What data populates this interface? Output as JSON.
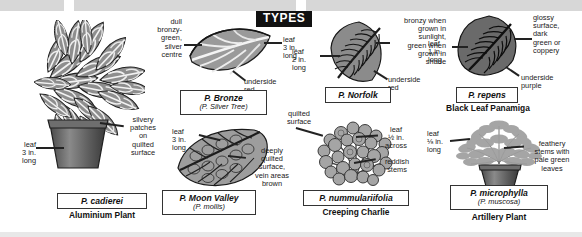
{
  "page": {
    "section_header": "TYPES"
  },
  "specimens": [
    {
      "id": "cadierei",
      "scientific_name": "P. cadierei",
      "synonym": "",
      "common_name": "Aluminium Plant",
      "annotations": [
        {
          "name": "leaf-size",
          "text": "leaf\n3 in.\nlong"
        },
        {
          "name": "surface-description",
          "text": "silvery\npatches\non\nquilted\nsurface"
        }
      ]
    },
    {
      "id": "bronze",
      "scientific_name": "P. Bronze",
      "synonym": "(P. Silver Tree)",
      "common_name": "",
      "annotations": [
        {
          "name": "colour-description",
          "text": "dull\nbronzy-\ngreen,\nsilver\ncentre"
        },
        {
          "name": "leaf-size",
          "text": "leaf\n3 in.\nlong"
        },
        {
          "name": "underside-colour",
          "text": "underside\nred"
        }
      ]
    },
    {
      "id": "norfolk",
      "scientific_name": "P. Norfolk",
      "synonym": "",
      "common_name": "",
      "annotations": [
        {
          "name": "leaf-size",
          "text": "leaf\n2 in.\nlong"
        },
        {
          "name": "colour-description",
          "text": "bronzy when\ngrown in\nsunlight,\ngreen when\ngrown in\nshade"
        },
        {
          "name": "underside-colour",
          "text": "underside\nred"
        }
      ]
    },
    {
      "id": "repens",
      "scientific_name": "P. repens",
      "synonym": "",
      "common_name": "Black Leaf Panamiga",
      "annotations": [
        {
          "name": "leaf-size",
          "text": "leaf\n1 in.\nlong"
        },
        {
          "name": "surface-description",
          "text": "glossy\nsurface,\ndark\ngreen or\ncoppery"
        },
        {
          "name": "underside-colour",
          "text": "underside\npurple"
        }
      ]
    },
    {
      "id": "moon-valley",
      "scientific_name": "P. Moon Valley",
      "synonym": "(P. mollis)",
      "common_name": "",
      "annotations": [
        {
          "name": "leaf-size",
          "text": "leaf\n3 in.\nlong"
        },
        {
          "name": "surface-description",
          "text": "deeply\nquilted\nsurface,\nvein areas\nbrown"
        }
      ]
    },
    {
      "id": "nummulariifolia",
      "scientific_name": "P. nummulariifolia",
      "synonym": "",
      "common_name": "Creeping Charlie",
      "annotations": [
        {
          "name": "surface-description",
          "text": "quilted\nsurface"
        },
        {
          "name": "leaf-size",
          "text": "leaf\n½ in.\nacross"
        },
        {
          "name": "stem-description",
          "text": "reddish\nstems"
        }
      ]
    },
    {
      "id": "microphylla",
      "scientific_name": "P. microphylla",
      "synonym": "(P. muscosa)",
      "common_name": "Artillery Plant",
      "annotations": [
        {
          "name": "leaf-size",
          "text": "leaf\n⅛ in.\nlong"
        },
        {
          "name": "stem-description",
          "text": "feathery\nstems with\npale green\nleaves"
        }
      ]
    }
  ],
  "colors": {
    "header_bg": "#111111",
    "header_text": "#ffffff",
    "plate_border": "#333333",
    "text": "#1a1a1a",
    "band": "#d7d7d7"
  }
}
